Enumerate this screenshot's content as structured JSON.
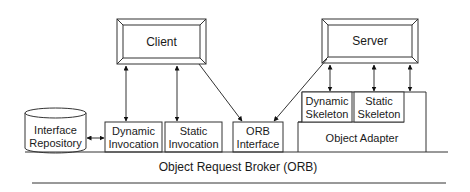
{
  "diagram": {
    "client": {
      "label": "Client"
    },
    "server": {
      "label": "Server"
    },
    "interface_repository": {
      "line1": "Interface",
      "line2": "Repository"
    },
    "dynamic_invocation": {
      "line1": "Dynamic",
      "line2": "Invocation"
    },
    "static_invocation": {
      "line1": "Static",
      "line2": "Invocation"
    },
    "orb_interface": {
      "line1": "ORB",
      "line2": "Interface"
    },
    "dynamic_skeleton": {
      "line1": "Dynamic",
      "line2": "Skeleton"
    },
    "static_skeleton": {
      "line1": "Static",
      "line2": "Skeleton"
    },
    "object_adapter": {
      "label": "Object Adapter"
    },
    "orb": {
      "label": "Object Request Broker (ORB)"
    }
  }
}
